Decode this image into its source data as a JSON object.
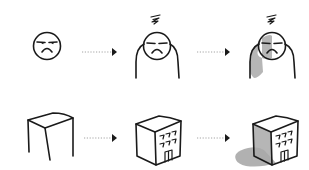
{
  "diagram": {
    "description": "Two-row sketch progression from simple outline to detailed shaded form",
    "rows": [
      {
        "name": "character",
        "steps": [
          {
            "label": "Face outline",
            "icon": "frown-face-icon"
          },
          {
            "label": "Face with body and confusion squiggle",
            "icon": "figure-icon"
          },
          {
            "label": "Shaded figure",
            "icon": "shaded-figure-icon"
          }
        ]
      },
      {
        "name": "building",
        "steps": [
          {
            "label": "Box outline",
            "icon": "box-icon"
          },
          {
            "label": "Building with windows and door",
            "icon": "building-icon"
          },
          {
            "label": "Shaded building with cast shadow",
            "icon": "shaded-building-icon"
          }
        ]
      }
    ],
    "arrow": {
      "style": "dotted",
      "head": "filled-triangle",
      "color": "#1a1a1a",
      "line_color": "#9a9a9a"
    },
    "colors": {
      "ink": "#1a1a1a",
      "shade": "#a9a9a9",
      "background": "#ffffff"
    }
  }
}
